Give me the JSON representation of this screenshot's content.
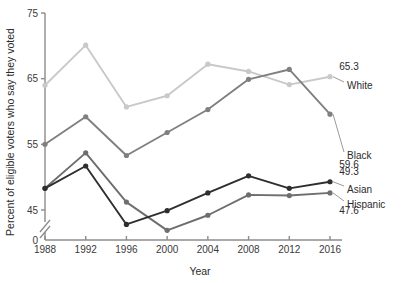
{
  "chart_data": {
    "type": "line",
    "title": "",
    "xlabel": "Year",
    "ylabel": "Percent of eligible voters who say they voted",
    "x": [
      1988,
      1992,
      1996,
      2000,
      2004,
      2008,
      2012,
      2016
    ],
    "categories": [
      "1988",
      "1992",
      "1996",
      "2000",
      "2004",
      "2008",
      "2012",
      "2016"
    ],
    "ylim": [
      45,
      75
    ],
    "yticks": [
      45,
      55,
      65,
      75
    ],
    "ytick_labels": [
      "45",
      "55",
      "65",
      "75"
    ],
    "zero_tick_label": "0",
    "axis_break": true,
    "grid": false,
    "legend_position": "right-inline",
    "series": [
      {
        "name": "White",
        "color": "#c9c9c9",
        "values": [
          64.0,
          70.1,
          60.7,
          62.4,
          67.2,
          66.1,
          64.1,
          65.3
        ],
        "end_label": "White",
        "end_value_label": "65.3"
      },
      {
        "name": "Black",
        "color": "#808080",
        "values": [
          55.0,
          59.2,
          53.3,
          56.8,
          60.3,
          64.9,
          66.4,
          59.6
        ],
        "end_label": "Black",
        "end_value_label": "59.6"
      },
      {
        "name": "Asian",
        "color": "#2e2e2e",
        "values": [
          48.3,
          51.7,
          42.8,
          44.9,
          47.6,
          50.2,
          48.3,
          49.3
        ],
        "end_label": "Asian",
        "end_value_label": "49.3"
      },
      {
        "name": "Hispanic",
        "color": "#6e6e6e",
        "values": [
          48.3,
          53.7,
          46.2,
          41.9,
          44.2,
          47.3,
          47.2,
          47.6
        ],
        "end_label": "Hispanic",
        "end_value_label": "47.6"
      }
    ]
  },
  "axis": {
    "y_title": "Percent of eligible voters who say they voted",
    "x_title": "Year"
  },
  "footnote": {
    "text": ""
  }
}
